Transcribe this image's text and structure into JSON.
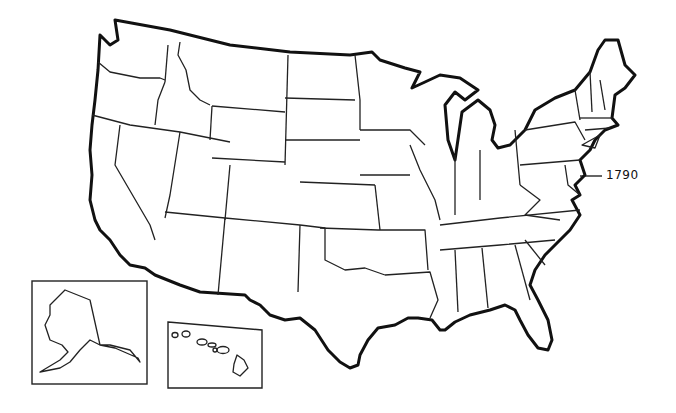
{
  "map": {
    "subject": "United States outline map",
    "annotation": {
      "label": "1790",
      "points_to": "Delaware / Maryland region"
    },
    "insets": [
      {
        "name": "Alaska"
      },
      {
        "name": "Hawaii"
      }
    ],
    "colors": {
      "line": "#111111",
      "background": "#ffffff"
    }
  }
}
